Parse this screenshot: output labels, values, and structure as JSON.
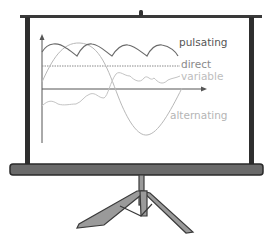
{
  "diagram": {
    "labels": {
      "pulsating": "pulsating",
      "direct": "direct",
      "variable": "variable",
      "alternating": "alternating"
    },
    "colors": {
      "frame": "#333333",
      "screen": "#ffffff",
      "pulsating": "#666666",
      "direct": "#8a8a8a",
      "variable": "#c4c4c4",
      "alternating": "#b0b0b0",
      "axes": "#555555"
    }
  }
}
